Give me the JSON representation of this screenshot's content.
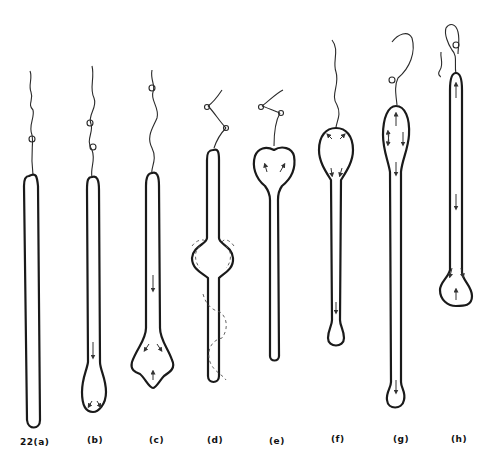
{
  "figure": {
    "number": "22",
    "panels": [
      {
        "id": "a",
        "label": "22(a)",
        "description": "long thin uniform column with thread at top"
      },
      {
        "id": "b",
        "label": "(b)",
        "description": "column with small bulb at bottom, downward arrow"
      },
      {
        "id": "c",
        "label": "(c)",
        "description": "column with diamond-shaped bulb at bottom, arrows"
      },
      {
        "id": "d",
        "label": "(d)",
        "description": "column with bulge in middle, dashed circulation paths"
      },
      {
        "id": "e",
        "label": "(e)",
        "description": "heart-shaped bulb at top, thin stem below"
      },
      {
        "id": "f",
        "label": "(f)",
        "description": "rounded bulb at top, stem with small bulb at bottom"
      },
      {
        "id": "g",
        "label": "(g)",
        "description": "elongated bulb at top, stem with small bulb at bottom"
      },
      {
        "id": "h",
        "label": "(h)",
        "description": "long column with bulb at bottom, upward and downward arrows"
      }
    ]
  },
  "colors": {
    "stroke": "#1a1a1a",
    "background": "#ffffff"
  }
}
